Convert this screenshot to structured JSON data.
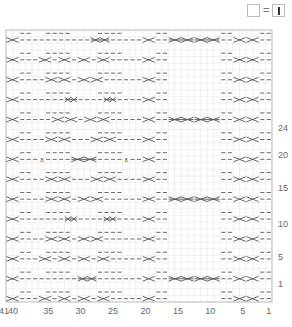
{
  "legend": {
    "empty_cell_equals": "=",
    "symbol": "knit-stitch-vertical-bar",
    "description": "empty square = knit (|)"
  },
  "chart": {
    "type": "knitting-chart",
    "columns": 41,
    "rows": 41,
    "grid_left": 6,
    "grid_top": 30,
    "grid_right": 272,
    "grid_bottom": 302,
    "grid_color": "#e2e2e2",
    "border_color": "#bdbdbd",
    "symbol_color": "#555555",
    "x_tick_labels": [
      {
        "label": "41",
        "col": 41
      },
      {
        "label": "40",
        "col": 40
      },
      {
        "label": "35",
        "col": 35
      },
      {
        "label": "30",
        "col": 30
      },
      {
        "label": "25",
        "col": 25
      },
      {
        "label": "20",
        "col": 20
      },
      {
        "label": "15",
        "col": 15
      },
      {
        "label": "10",
        "col": 10
      },
      {
        "label": "5",
        "col": 5
      },
      {
        "label": "1",
        "col": 1
      }
    ],
    "y_tick_labels": [
      {
        "label": "24",
        "y": 131
      },
      {
        "label": "20",
        "y": 158
      },
      {
        "label": "15",
        "y": 191
      },
      {
        "label": "10",
        "y": 227
      },
      {
        "label": "5",
        "y": 260
      },
      {
        "label": "1",
        "y": 287
      }
    ],
    "pattern_rows": [
      "X--  ----C----  --X--  CCCCCCC  --XX--",
      "X--XX--c-c--XX--X-- XX XX --XX--",
      "X---XXc---cXX---X-- ...",
      "X----C-----C----X--  CCCCCCC  --XX--"
    ]
  }
}
